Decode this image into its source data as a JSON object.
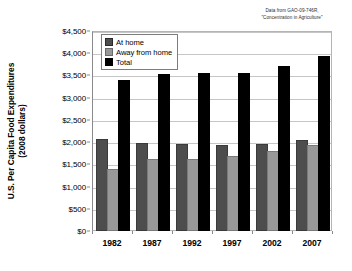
{
  "source_note": {
    "line1": "Data from GAO-09-746R,",
    "line2": "\"Concentration in Agriculture\""
  },
  "axis": {
    "y_title_line1": "U.S. Per Capita Food Expenditures",
    "y_title_line2": "(2008 dollars)"
  },
  "legend": {
    "items": [
      {
        "label": "At home",
        "color": "#4d4d4d",
        "key": "athome"
      },
      {
        "label": "Away from home",
        "color": "#989898",
        "key": "away"
      },
      {
        "label": "Total",
        "color": "#000000",
        "key": "total"
      }
    ]
  },
  "chart_data": {
    "type": "bar",
    "title": "",
    "subtitle": "",
    "xlabel": "",
    "ylabel": "U.S. Per Capita Food Expenditures (2008 dollars)",
    "categories": [
      "1982",
      "1987",
      "1992",
      "1997",
      "2002",
      "2007"
    ],
    "series": [
      {
        "name": "At home",
        "color": "#4d4d4d",
        "values": [
          2020,
          1930,
          1920,
          1880,
          1910,
          2010
        ]
      },
      {
        "name": "Away from home",
        "color": "#989898",
        "values": [
          1340,
          1570,
          1580,
          1640,
          1760,
          1890
        ]
      },
      {
        "name": "Total",
        "color": "#000000",
        "values": [
          3360,
          3490,
          3500,
          3510,
          3670,
          3900
        ]
      }
    ],
    "ylim": [
      0,
      4500
    ],
    "ytick_step": 500,
    "ytick_labels": [
      "$4,500",
      "$4,000",
      "$3,500",
      "$3,000",
      "$2,500",
      "$2,000",
      "$1,500",
      "$1,000",
      "$500",
      "$0"
    ],
    "ytick_values": [
      4500,
      4000,
      3500,
      3000,
      2500,
      2000,
      1500,
      1000,
      500,
      0
    ],
    "grid": true,
    "legend_position": "top-left",
    "annotations": [
      "Data from GAO-09-746R, \"Concentration in Agriculture\""
    ]
  }
}
